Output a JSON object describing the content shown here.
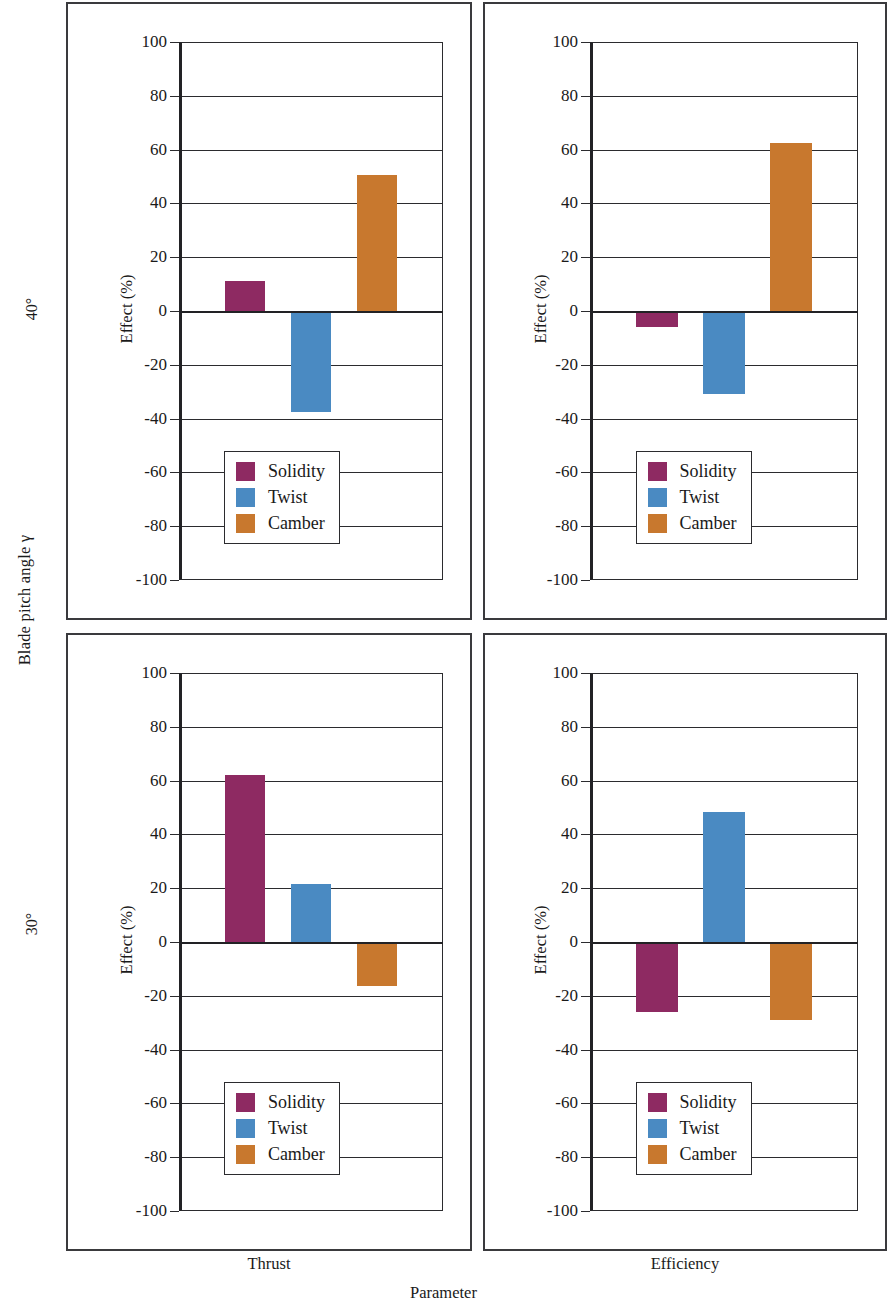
{
  "figure": {
    "row_axis_title": "Blade pitch angle γ",
    "x_axis_title": "Parameter",
    "row_labels": [
      "40°",
      "30°"
    ],
    "column_labels": [
      "Thrust",
      "Efficiency"
    ]
  },
  "colors": {
    "solidity": "#8E2A62",
    "twist": "#4A8AC2",
    "camber": "#C8782E",
    "axis": "#2b2b2e",
    "panel_border": "#3a3a3d",
    "background": "#ffffff"
  },
  "legend": {
    "entries": [
      {
        "label": "Solidity",
        "color": "#8E2A62"
      },
      {
        "label": "Twist",
        "color": "#4A8AC2"
      },
      {
        "label": "Camber",
        "color": "#C8782E"
      }
    ]
  },
  "axis": {
    "ylabel": "Effect (%)",
    "yticks": [
      100,
      80,
      60,
      40,
      20,
      0,
      -20,
      -40,
      -60,
      -80,
      -100
    ],
    "ytick_labels": [
      "100",
      "80",
      "60",
      "40",
      "20",
      "0",
      "-20",
      "-40",
      "-60",
      "-80",
      "-100"
    ],
    "ymin": -100,
    "ymax": 100
  },
  "chart_data": [
    {
      "type": "bar",
      "title": "Thrust — Blade pitch angle γ = 40°",
      "panel": "top-left",
      "row": "40°",
      "column": "Thrust",
      "xlabel": "Parameter",
      "ylabel": "Effect (%)",
      "ylim": [
        -100,
        100
      ],
      "grid": true,
      "legend_position": "lower-center",
      "categories": [
        "Solidity",
        "Twist",
        "Camber"
      ],
      "values": [
        11,
        -37.5,
        50.5
      ]
    },
    {
      "type": "bar",
      "title": "Efficiency — Blade pitch angle γ = 40°",
      "panel": "top-right",
      "row": "40°",
      "column": "Efficiency",
      "xlabel": "Parameter",
      "ylabel": "Effect (%)",
      "ylim": [
        -100,
        100
      ],
      "grid": true,
      "legend_position": "lower-center",
      "categories": [
        "Solidity",
        "Twist",
        "Camber"
      ],
      "values": [
        -6,
        -31,
        62.5
      ]
    },
    {
      "type": "bar",
      "title": "Thrust — Blade pitch angle γ = 30°",
      "panel": "bottom-left",
      "row": "30°",
      "column": "Thrust",
      "xlabel": "Parameter",
      "ylabel": "Effect (%)",
      "ylim": [
        -100,
        100
      ],
      "grid": true,
      "legend_position": "lower-center",
      "categories": [
        "Solidity",
        "Twist",
        "Camber"
      ],
      "values": [
        62,
        21.5,
        -16.5
      ]
    },
    {
      "type": "bar",
      "title": "Efficiency — Blade pitch angle γ = 30°",
      "panel": "bottom-right",
      "row": "30°",
      "column": "Efficiency",
      "xlabel": "Parameter",
      "ylabel": "Effect (%)",
      "ylim": [
        -100,
        100
      ],
      "grid": true,
      "legend_position": "lower-center",
      "categories": [
        "Solidity",
        "Twist",
        "Camber"
      ],
      "values": [
        -26,
        48.5,
        -29
      ]
    }
  ]
}
